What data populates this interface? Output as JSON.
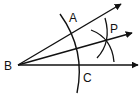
{
  "diagram": {
    "type": "geometry-angle-bisector-construction",
    "stroke_color": "#111111",
    "background": "#ffffff",
    "vertex": {
      "label": "B",
      "x": 18,
      "y": 65
    },
    "points": {
      "A": {
        "label": "A",
        "x": 75,
        "y": 18
      },
      "P": {
        "label": "P",
        "x": 113,
        "y": 28
      },
      "C": {
        "label": "C",
        "x": 88,
        "y": 79
      }
    },
    "rays": [
      {
        "name": "ray-BA",
        "x1": 18,
        "y1": 65,
        "x2": 122,
        "y2": 3
      },
      {
        "name": "ray-BP",
        "x1": 18,
        "y1": 65,
        "x2": 133,
        "y2": 32
      },
      {
        "name": "ray-BC",
        "x1": 18,
        "y1": 65,
        "x2": 139,
        "y2": 65
      }
    ]
  }
}
